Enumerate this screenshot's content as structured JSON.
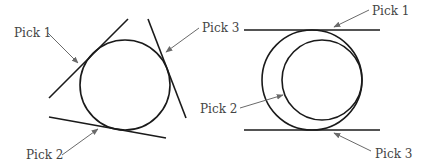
{
  "colors": {
    "background": "#ffffff",
    "shape_stroke": "#1a1a1a",
    "leader_stroke": "#6a6a6a",
    "label_text": "#444444"
  },
  "left_diagram": {
    "description": "Circle tangent to three lines",
    "labels": {
      "pick1": "Pick 1",
      "pick2": "Pick 2",
      "pick3": "Pick 3"
    }
  },
  "right_diagram": {
    "description": "Circle tangent to two parallel lines and another circle",
    "labels": {
      "pick1": "Pick 1",
      "pick2": "Pick 2",
      "pick3": "Pick 3"
    }
  }
}
